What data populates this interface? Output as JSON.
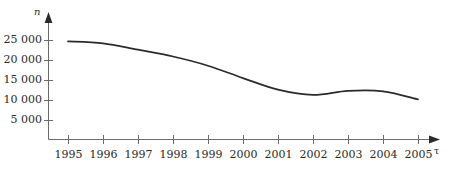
{
  "chart_data": {
    "type": "line",
    "title": "",
    "subtitle": "",
    "xlabel": "τ",
    "ylabel": "n",
    "categories": [
      "1995",
      "1996",
      "1997",
      "1998",
      "1999",
      "2000",
      "2001",
      "2002",
      "2003",
      "2004",
      "2005"
    ],
    "x": [
      1995,
      1996,
      1997,
      1998,
      1999,
      2000,
      2001,
      2002,
      2003,
      2004,
      2005
    ],
    "values": [
      24800,
      24300,
      22700,
      21000,
      18700,
      15600,
      12700,
      11400,
      12400,
      12300,
      10300
    ],
    "series": [
      {
        "name": "n",
        "values": [
          24800,
          24300,
          22700,
          21000,
          18700,
          15600,
          12700,
          11400,
          12400,
          12300,
          10300
        ]
      }
    ],
    "xlim": [
      1995,
      2005
    ],
    "ylim": [
      0,
      27000
    ],
    "ytick_values": [
      25000,
      20000,
      15000,
      10000,
      5000
    ],
    "ytick_labels": [
      "25 000",
      "20 000",
      "15 000",
      "10 000",
      "5 000"
    ],
    "xtick_labels": [
      "1995",
      "1996",
      "1997",
      "1998",
      "1999",
      "2000",
      "2001",
      "2002",
      "2003",
      "2004",
      "2005"
    ],
    "grid": false,
    "legend": null,
    "legend_position": "none",
    "annotations": [],
    "line_color": "#2b2b2b",
    "axis_color": "#6b6b6b",
    "background_color": "#ffffff"
  },
  "axes": {
    "y_name": "n",
    "x_name": "τ"
  }
}
